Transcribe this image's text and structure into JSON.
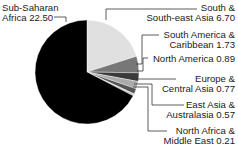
{
  "chart_data": {
    "type": "pie",
    "title": "",
    "start_angle_deg": 0,
    "direction": "clockwise",
    "slices": [
      {
        "label": "South & South-east Asia",
        "value": 6.7,
        "color": "#e0e0e0"
      },
      {
        "label": "South America & Caribbean",
        "value": 1.73,
        "color": "#777777"
      },
      {
        "label": "North America",
        "value": 0.89,
        "color": "#3a3a3a"
      },
      {
        "label": "Europe & Central Asia",
        "value": 0.77,
        "color": "#aaaaaa"
      },
      {
        "label": "East Asia & Australasia",
        "value": 0.57,
        "color": "#555555"
      },
      {
        "label": "North Africa & Middle East",
        "value": 0.21,
        "color": "#cccccc"
      },
      {
        "label": "Sub-Saharan Africa",
        "value": 22.5,
        "color": "#000000"
      }
    ],
    "legend": "none (leader-line labels)"
  },
  "labels": {
    "ssa_line1": "Sub-Saharan",
    "ssa_line2": "Africa 22.50",
    "sea_line1": "South &",
    "sea_line2": "South-east Asia 6.70",
    "sam_line1": "South America &",
    "sam_line2": "Caribbean 1.73",
    "nam_line1": "North America 0.89",
    "eur_line1": "Europe &",
    "eur_line2": "Central Asia 0.77",
    "eas_line1": "East Asia &",
    "eas_line2": "Australasia 0.57",
    "naf_line1": "North Africa &",
    "naf_line2": "Middle East 0.21"
  }
}
